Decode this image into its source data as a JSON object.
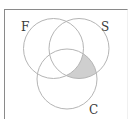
{
  "diagram": {
    "type": "venn",
    "sets": [
      {
        "id": "F",
        "label": "F",
        "cx": 53.5,
        "cy": 48.5,
        "r": 30
      },
      {
        "id": "S",
        "label": "S",
        "cx": 79,
        "cy": 48.5,
        "r": 30
      },
      {
        "id": "C",
        "label": "C",
        "cx": 67,
        "cy": 79,
        "r": 30
      }
    ],
    "shaded_region": "S ∩ C ∩ F'",
    "colors": {
      "circle_stroke": "#b5b5b5",
      "shade_fill": "#cfcfcf",
      "frame": "#8a8a8a",
      "label": "#3a3a3a"
    },
    "labels": {
      "F": "F",
      "S": "S",
      "C": "C"
    }
  }
}
